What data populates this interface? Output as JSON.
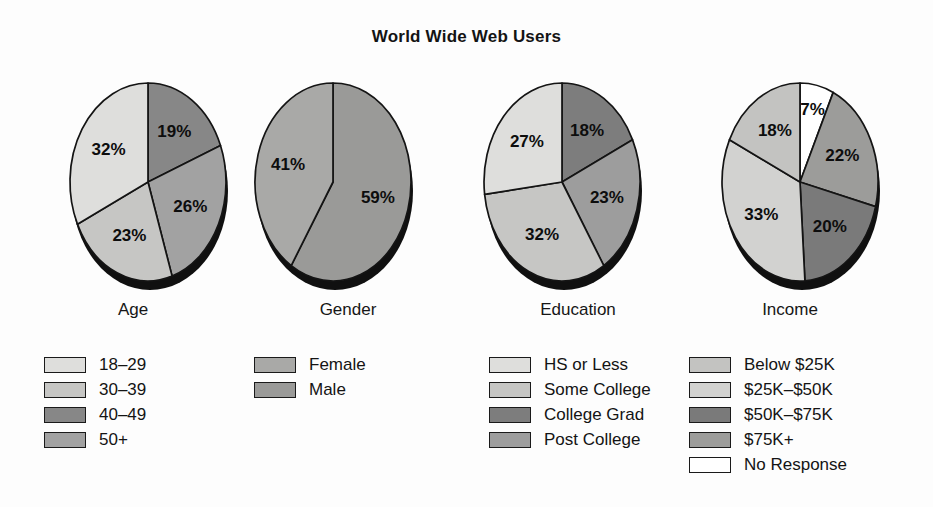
{
  "chart_title": "World Wide Web Users",
  "chart_data": [
    {
      "type": "pie",
      "title": "Age",
      "categories": [
        "18–29",
        "30–39",
        "40–49",
        "50+"
      ],
      "values": [
        32,
        23,
        19,
        26
      ],
      "data_labels": [
        "32%",
        "23%",
        "19%",
        "26%"
      ],
      "colors": [
        "#dededc",
        "#c6c6c4",
        "#878787",
        "#a2a2a2"
      ],
      "legend_position": "below",
      "slice_order_clockwise_from_top": [
        "40–49",
        "50+",
        "30–39",
        "18–29"
      ]
    },
    {
      "type": "pie",
      "title": "Gender",
      "categories": [
        "Female",
        "Male"
      ],
      "values": [
        41,
        59
      ],
      "data_labels": [
        "41%",
        "59%"
      ],
      "colors": [
        "#a9a9a7",
        "#9a9a98"
      ],
      "legend_position": "below",
      "slice_order_clockwise_from_top": [
        "Male",
        "Female"
      ]
    },
    {
      "type": "pie",
      "title": "Education",
      "categories": [
        "HS or Less",
        "Some College",
        "College Grad",
        "Post College"
      ],
      "values": [
        27,
        32,
        18,
        23
      ],
      "data_labels": [
        "27%",
        "32%",
        "18%",
        "23%"
      ],
      "colors": [
        "#dededc",
        "#c6c6c4",
        "#7d7d7d",
        "#9d9d9d"
      ],
      "legend_position": "below",
      "slice_order_clockwise_from_top": [
        "College Grad",
        "Post College",
        "Some College",
        "HS or Less"
      ]
    },
    {
      "type": "pie",
      "title": "Income",
      "categories": [
        "Below $25K",
        "$25K–$50K",
        "$50K–$75K",
        "$75K+",
        "No Response"
      ],
      "values": [
        18,
        33,
        20,
        22,
        7
      ],
      "data_labels": [
        "18%",
        "33%",
        "20%",
        "22%",
        "7%"
      ],
      "colors": [
        "#c3c3c1",
        "#d2d2d0",
        "#7a7a7a",
        "#9c9c9a",
        "#ffffff"
      ],
      "legend_position": "below",
      "slice_order_clockwise_from_top": [
        "No Response",
        "$75K+",
        "$50K–$75K",
        "$25K–$50K",
        "Below $25K"
      ]
    }
  ],
  "panels": [
    {
      "label": "Age",
      "slices": [
        {
          "label": "19%",
          "value": 19,
          "color": "#878787",
          "legend": "40–49"
        },
        {
          "label": "26%",
          "value": 26,
          "color": "#a2a2a2",
          "legend": "50+"
        },
        {
          "label": "23%",
          "value": 23,
          "color": "#c6c6c4",
          "legend": "30–39"
        },
        {
          "label": "32%",
          "value": 32,
          "color": "#dededc",
          "legend": "18–29"
        }
      ],
      "legend": [
        {
          "label": "18–29",
          "color": "#dededc"
        },
        {
          "label": "30–39",
          "color": "#c6c6c4"
        },
        {
          "label": "40–49",
          "color": "#878787"
        },
        {
          "label": "50+",
          "color": "#a2a2a2"
        }
      ]
    },
    {
      "label": "Gender",
      "slices": [
        {
          "label": "59%",
          "value": 59,
          "color": "#9a9a98",
          "legend": "Male"
        },
        {
          "label": "41%",
          "value": 41,
          "color": "#a9a9a7",
          "legend": "Female"
        }
      ],
      "legend": [
        {
          "label": "Female",
          "color": "#a9a9a7"
        },
        {
          "label": "Male",
          "color": "#9a9a98"
        }
      ]
    },
    {
      "label": "Education",
      "slices": [
        {
          "label": "18%",
          "value": 18,
          "color": "#7d7d7d",
          "legend": "College Grad"
        },
        {
          "label": "23%",
          "value": 23,
          "color": "#9d9d9d",
          "legend": "Post College"
        },
        {
          "label": "32%",
          "value": 32,
          "color": "#c6c6c4",
          "legend": "Some College"
        },
        {
          "label": "27%",
          "value": 27,
          "color": "#dededc",
          "legend": "HS or Less"
        }
      ],
      "legend": [
        {
          "label": "HS or Less",
          "color": "#dededc"
        },
        {
          "label": "Some College",
          "color": "#c6c6c4"
        },
        {
          "label": "College Grad",
          "color": "#7d7d7d"
        },
        {
          "label": "Post College",
          "color": "#9d9d9d"
        }
      ]
    },
    {
      "label": "Income",
      "slices": [
        {
          "label": "7%",
          "value": 7,
          "color": "#ffffff",
          "legend": "No Response"
        },
        {
          "label": "22%",
          "value": 22,
          "color": "#9c9c9a",
          "legend": "$75K+"
        },
        {
          "label": "20%",
          "value": 20,
          "color": "#7a7a7a",
          "legend": "$50K–$75K"
        },
        {
          "label": "33%",
          "value": 33,
          "color": "#d2d2d0",
          "legend": "$25K–$50K"
        },
        {
          "label": "18%",
          "value": 18,
          "color": "#c3c3c1",
          "legend": "Below $25K"
        }
      ],
      "legend": [
        {
          "label": "Below $25K",
          "color": "#c3c3c1"
        },
        {
          "label": "$25K–$50K",
          "color": "#d2d2d0"
        },
        {
          "label": "$50K–$75K",
          "color": "#7a7a7a"
        },
        {
          "label": "$75K+",
          "color": "#9c9c9a"
        },
        {
          "label": "No Response",
          "color": "#ffffff"
        }
      ]
    }
  ],
  "style": {
    "shadow_color": "#101010",
    "outline_color": "#141414",
    "background": "#fdfdfd"
  }
}
